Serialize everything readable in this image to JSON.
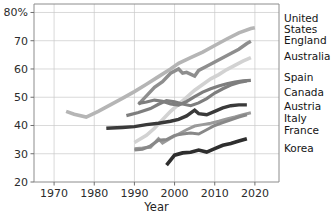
{
  "chart_data": {
    "type": "line",
    "title": "",
    "xlabel": "Year",
    "ylabel": "",
    "xlim": [
      1965,
      2026
    ],
    "ylim": [
      20,
      83
    ],
    "grid": true,
    "legend_position": "right-inline-labels",
    "x_ticks": [
      1970,
      1980,
      1990,
      2000,
      2010,
      2020
    ],
    "x_tick_labels": [
      "1970",
      "1980",
      "1990",
      "2000",
      "2010",
      "2020"
    ],
    "y_ticks": [
      20,
      30,
      40,
      50,
      60,
      70,
      80
    ],
    "y_tick_labels": [
      "20",
      "30",
      "40",
      "50",
      "60",
      "70",
      "80%"
    ],
    "series": [
      {
        "name": "United States",
        "label_lines": [
          "United",
          "States"
        ],
        "color": "#b5b5b5",
        "width": 3.6,
        "label_y": 22,
        "points": [
          [
            1973,
            45.0
          ],
          [
            1975,
            44.0
          ],
          [
            1978,
            43.0
          ],
          [
            1981,
            45.0
          ],
          [
            1984,
            47.3
          ],
          [
            1987,
            49.6
          ],
          [
            1990,
            52.0
          ],
          [
            1993,
            54.6
          ],
          [
            1996,
            57.3
          ],
          [
            1999,
            60.0
          ],
          [
            2001,
            62.0
          ],
          [
            2004,
            64.0
          ],
          [
            2007,
            66.0
          ],
          [
            2010,
            68.3
          ],
          [
            2013,
            70.6
          ],
          [
            2016,
            72.8
          ],
          [
            2019,
            74.3
          ],
          [
            2020,
            74.6
          ]
        ]
      },
      {
        "name": "England",
        "label_lines": [
          "England"
        ],
        "color": "#8e8e8e",
        "width": 3.4,
        "label_y": 44,
        "points": [
          [
            1991,
            47.5
          ],
          [
            1993,
            50.5
          ],
          [
            1995,
            53.5
          ],
          [
            1997,
            55.5
          ],
          [
            1999,
            58.5
          ],
          [
            2001,
            60.0
          ],
          [
            2002,
            58.5
          ],
          [
            2003,
            58.8
          ],
          [
            2005,
            57.5
          ],
          [
            2006,
            59.5
          ],
          [
            2008,
            61.0
          ],
          [
            2010,
            62.5
          ],
          [
            2012,
            64.0
          ],
          [
            2014,
            65.5
          ],
          [
            2016,
            67.0
          ],
          [
            2018,
            69.0
          ],
          [
            2019,
            69.8
          ]
        ]
      },
      {
        "name": "Australia",
        "label_lines": [
          "Australia"
        ],
        "color": "#d2d2d2",
        "width": 3.6,
        "label_y": 60,
        "points": [
          [
            1990,
            34.0
          ],
          [
            1993,
            36.5
          ],
          [
            1995,
            39.0
          ],
          [
            1997,
            42.0
          ],
          [
            1999,
            45.0
          ],
          [
            2001,
            47.5
          ],
          [
            2003,
            50.0
          ],
          [
            2005,
            52.5
          ],
          [
            2007,
            54.5
          ],
          [
            2009,
            56.5
          ],
          [
            2011,
            58.0
          ],
          [
            2013,
            59.8
          ],
          [
            2015,
            61.3
          ],
          [
            2017,
            62.8
          ],
          [
            2019,
            64.0
          ]
        ]
      },
      {
        "name": "Spain",
        "label_lines": [
          "Spain"
        ],
        "color": "#7e7e7e",
        "width": 3.2,
        "label_y": 81,
        "points": [
          [
            1991,
            47.8
          ],
          [
            1993,
            48.3
          ],
          [
            1995,
            49.0
          ],
          [
            1997,
            48.6
          ],
          [
            1999,
            47.6
          ],
          [
            2001,
            47.2
          ],
          [
            2003,
            48.5
          ],
          [
            2005,
            50.2
          ],
          [
            2007,
            51.8
          ],
          [
            2009,
            53.0
          ],
          [
            2011,
            54.0
          ],
          [
            2013,
            54.8
          ],
          [
            2015,
            55.4
          ],
          [
            2017,
            55.8
          ],
          [
            2019,
            56.0
          ]
        ]
      },
      {
        "name": "Canada",
        "label_lines": [
          "Canada"
        ],
        "color": "#7e7e7e",
        "width": 3.2,
        "label_y": 96,
        "points": [
          [
            1988,
            43.5
          ],
          [
            1991,
            44.6
          ],
          [
            1994,
            46.0
          ],
          [
            1996,
            47.5
          ],
          [
            1998,
            48.8
          ],
          [
            2000,
            48.4
          ],
          [
            2002,
            47.6
          ],
          [
            2004,
            47.0
          ],
          [
            2006,
            48.0
          ],
          [
            2008,
            49.5
          ],
          [
            2010,
            51.5
          ],
          [
            2012,
            53.0
          ],
          [
            2014,
            54.3
          ],
          [
            2016,
            55.2
          ],
          [
            2018,
            55.8
          ]
        ]
      },
      {
        "name": "Austria",
        "label_lines": [
          "Austria"
        ],
        "color": "#3a3a3a",
        "width": 3.4,
        "label_y": 110,
        "points": [
          [
            1983,
            39.0
          ],
          [
            1987,
            39.3
          ],
          [
            1990,
            39.6
          ],
          [
            1993,
            40.3
          ],
          [
            1996,
            40.8
          ],
          [
            1999,
            41.5
          ],
          [
            2001,
            42.2
          ],
          [
            2003,
            43.4
          ],
          [
            2005,
            45.4
          ],
          [
            2006,
            44.2
          ],
          [
            2008,
            43.8
          ],
          [
            2010,
            45.0
          ],
          [
            2012,
            46.2
          ],
          [
            2014,
            47.0
          ],
          [
            2016,
            47.3
          ],
          [
            2018,
            47.3
          ]
        ]
      },
      {
        "name": "Italy",
        "label_lines": [
          "Italy"
        ],
        "color": "#9a9a9a",
        "width": 3.0,
        "label_y": 122,
        "points": [
          [
            1990,
            31.8
          ],
          [
            1992,
            32.0
          ],
          [
            1994,
            32.3
          ],
          [
            1996,
            35.3
          ],
          [
            1997,
            33.8
          ],
          [
            1999,
            35.5
          ],
          [
            2001,
            37.0
          ],
          [
            2003,
            38.5
          ],
          [
            2005,
            39.8
          ],
          [
            2007,
            40.3
          ],
          [
            2009,
            40.8
          ],
          [
            2011,
            41.5
          ],
          [
            2013,
            42.3
          ],
          [
            2015,
            43.0
          ],
          [
            2017,
            43.8
          ],
          [
            2019,
            44.5
          ]
        ]
      },
      {
        "name": "France",
        "label_lines": [
          "France"
        ],
        "color": "#888888",
        "width": 3.0,
        "label_y": 134,
        "points": [
          [
            1990,
            31.3
          ],
          [
            1992,
            31.6
          ],
          [
            1994,
            32.8
          ],
          [
            1996,
            34.8
          ],
          [
            1998,
            35.0
          ],
          [
            2000,
            36.5
          ],
          [
            2002,
            37.0
          ],
          [
            2004,
            37.3
          ],
          [
            2006,
            37.0
          ],
          [
            2008,
            38.5
          ],
          [
            2010,
            40.0
          ],
          [
            2012,
            41.0
          ],
          [
            2014,
            42.0
          ],
          [
            2016,
            43.0
          ],
          [
            2018,
            43.8
          ]
        ]
      },
      {
        "name": "Korea",
        "label_lines": [
          "Korea"
        ],
        "color": "#2e2e2e",
        "width": 3.6,
        "label_y": 152,
        "points": [
          [
            1998,
            26.0
          ],
          [
            2000,
            29.5
          ],
          [
            2002,
            30.3
          ],
          [
            2004,
            30.5
          ],
          [
            2006,
            31.3
          ],
          [
            2008,
            30.6
          ],
          [
            2010,
            31.8
          ],
          [
            2012,
            33.0
          ],
          [
            2014,
            33.6
          ],
          [
            2016,
            34.5
          ],
          [
            2018,
            35.3
          ]
        ]
      }
    ]
  }
}
